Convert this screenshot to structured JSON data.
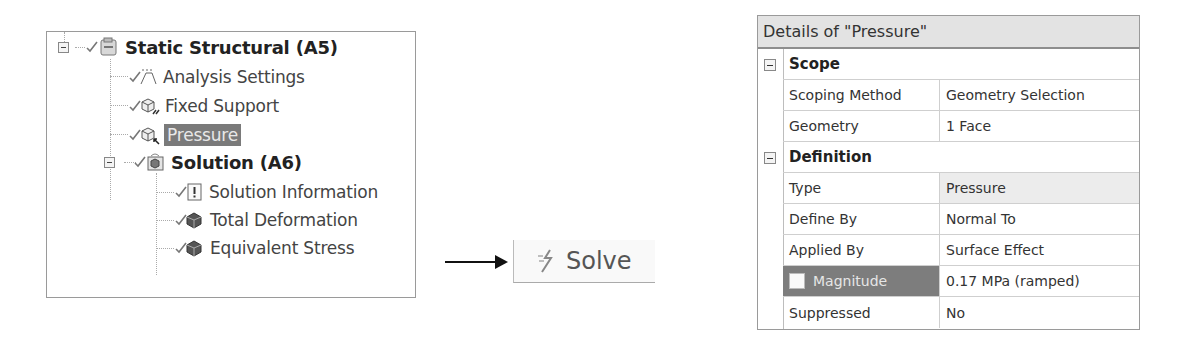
{
  "tree": {
    "items": [
      {
        "label": "Static Structural (A5)",
        "icon": "static-structural-icon",
        "bold": true,
        "expanded": true,
        "status": "check"
      },
      {
        "label": "Analysis Settings",
        "icon": "analysis-settings-icon",
        "status": "check"
      },
      {
        "label": "Fixed Support",
        "icon": "fixed-support-icon",
        "status": "check"
      },
      {
        "label": "Pressure",
        "icon": "pressure-icon",
        "status": "check",
        "selected": true
      },
      {
        "label": "Solution (A6)",
        "icon": "solution-icon",
        "bold": true,
        "expanded": true,
        "status": "check"
      },
      {
        "label": "Solution Information",
        "icon": "solution-information-icon",
        "status": "check"
      },
      {
        "label": "Total Deformation",
        "icon": "total-deformation-icon",
        "status": "check"
      },
      {
        "label": "Equivalent Stress",
        "icon": "equivalent-stress-icon",
        "status": "check"
      }
    ]
  },
  "toolbar": {
    "solve_label": "Solve",
    "solve_icon": "solve-lightning-icon"
  },
  "details": {
    "title": "Details of \"Pressure\"",
    "groups": [
      {
        "name": "Scope",
        "rows": [
          {
            "label": "Scoping Method",
            "value": "Geometry Selection"
          },
          {
            "label": "Geometry",
            "value": "1 Face"
          }
        ]
      },
      {
        "name": "Definition",
        "rows": [
          {
            "label": "Type",
            "value": "Pressure"
          },
          {
            "label": "Define By",
            "value": "Normal To"
          },
          {
            "label": "Applied By",
            "value": "Surface Effect"
          },
          {
            "label": "Magnitude",
            "value": "0.17 MPa  (ramped)"
          },
          {
            "label": "Suppressed",
            "value": "No"
          }
        ]
      }
    ]
  }
}
